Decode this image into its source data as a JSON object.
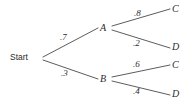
{
  "diagram": {
    "type": "probability-tree",
    "root": {
      "label": "Start",
      "x": 10,
      "y": 53
    },
    "level1": [
      {
        "id": "A",
        "label": "A",
        "x": 100,
        "y": 23,
        "probability": ".7",
        "prob_x": 60,
        "prob_y": 33
      },
      {
        "id": "B",
        "label": "B",
        "x": 100,
        "y": 74,
        "probability": ".3",
        "prob_x": 61,
        "prob_y": 69
      }
    ],
    "level2": [
      {
        "id": "A-C",
        "parent": "A",
        "label": "C",
        "x": 172,
        "y": 4,
        "probability": ".8",
        "prob_x": 134,
        "prob_y": 9
      },
      {
        "id": "A-D",
        "parent": "A",
        "label": "D",
        "x": 172,
        "y": 42,
        "probability": ".2",
        "prob_x": 133,
        "prob_y": 39
      },
      {
        "id": "B-C",
        "parent": "B",
        "label": "C",
        "x": 172,
        "y": 60,
        "probability": ".6",
        "prob_x": 133,
        "prob_y": 60
      },
      {
        "id": "B-D",
        "parent": "B",
        "label": "D",
        "x": 172,
        "y": 89,
        "probability": ".4",
        "prob_x": 133,
        "prob_y": 87
      }
    ],
    "edges": [
      {
        "id": "edge-start-a",
        "from": "Start",
        "to": "A",
        "x1": 43,
        "y1": 57,
        "x2": 98,
        "y2": 28
      },
      {
        "id": "edge-start-b",
        "from": "Start",
        "to": "B",
        "x1": 43,
        "y1": 60,
        "x2": 98,
        "y2": 79
      },
      {
        "id": "edge-a-c",
        "from": "A",
        "to": "C",
        "x1": 112,
        "y1": 26,
        "x2": 170,
        "y2": 9
      },
      {
        "id": "edge-a-d",
        "from": "A",
        "to": "D",
        "x1": 112,
        "y1": 30,
        "x2": 170,
        "y2": 48
      },
      {
        "id": "edge-b-c",
        "from": "B",
        "to": "C",
        "x1": 112,
        "y1": 77,
        "x2": 170,
        "y2": 65
      },
      {
        "id": "edge-b-d",
        "from": "B",
        "to": "D",
        "x1": 112,
        "y1": 81,
        "x2": 170,
        "y2": 95
      }
    ],
    "colors": {
      "line": "#4a4a4a",
      "text": "#2b2b2b",
      "background": "#ffffff"
    }
  },
  "chart_data": {
    "type": "diagram",
    "title": "",
    "nodes": [
      "Start",
      "A",
      "B",
      "C",
      "D",
      "C",
      "D"
    ],
    "branch_probabilities": [
      ".7",
      ".3",
      ".8",
      ".2",
      ".6",
      ".4"
    ],
    "paths": [
      {
        "sequence": [
          "Start",
          "A",
          "C"
        ],
        "probabilities": [
          ".7",
          ".8"
        ]
      },
      {
        "sequence": [
          "Start",
          "A",
          "D"
        ],
        "probabilities": [
          ".7",
          ".2"
        ]
      },
      {
        "sequence": [
          "Start",
          "B",
          "C"
        ],
        "probabilities": [
          ".3",
          ".6"
        ]
      },
      {
        "sequence": [
          "Start",
          "B",
          "D"
        ],
        "probabilities": [
          ".3",
          ".4"
        ]
      }
    ]
  }
}
